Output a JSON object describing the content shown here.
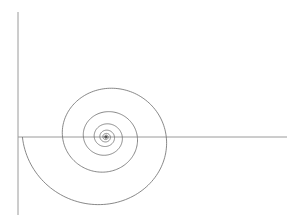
{
  "figure": {
    "type": "logarithmic-spiral",
    "background": "#ffffff",
    "axis_color": "#9a9a9a",
    "curve_color": "#6a6a6a",
    "axes": {
      "horizontal": {
        "x1": 18,
        "y1": 137,
        "x2": 287,
        "y2": 137
      },
      "vertical": {
        "x1": 18,
        "y1": 12,
        "x2": 18,
        "y2": 215
      }
    },
    "spiral": {
      "center": [
        106,
        137
      ],
      "start_radius": 88,
      "start_angle_deg": 180,
      "turns": 9,
      "growth_per_turn": 0.52,
      "y_scale": 0.9
    }
  }
}
